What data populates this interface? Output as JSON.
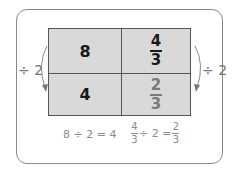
{
  "diagram": {
    "grid": {
      "cells": [
        {
          "row": 0,
          "col": 0,
          "text": "8"
        },
        {
          "row": 0,
          "col": 1,
          "numerator": "4",
          "denominator": "3"
        },
        {
          "row": 1,
          "col": 0,
          "text": "4"
        },
        {
          "row": 1,
          "col": 1,
          "numerator": "2",
          "denominator": "3"
        }
      ]
    },
    "left_label": "÷ 2",
    "right_label": "÷ 2",
    "equations": {
      "left": "8 ÷ 2 = 4",
      "right": {
        "lhs_numerator": "4",
        "lhs_denominator": "3",
        "middle": "÷ 2 =",
        "rhs_numerator": "2",
        "rhs_denominator": "3"
      }
    },
    "colors": {
      "cell_fill": "#d9d9d9",
      "frame": "#8a8a8a",
      "grid_line": "#555555",
      "text_dark": "#1a1a1a",
      "text_gray": "#7a7a7a"
    }
  }
}
